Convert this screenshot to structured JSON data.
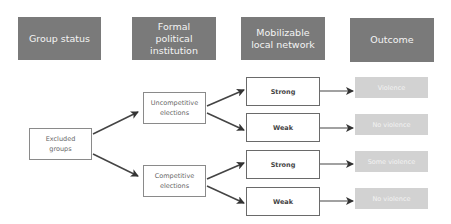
{
  "headers": {
    "group_status": "Group status",
    "institution": "Formal political institution",
    "network": "Mobilizable local network",
    "outcome": "Outcome"
  },
  "nodes": {
    "excluded": "Excluded groups",
    "uncompetitive": "Uncompetitive elections",
    "competitive": "Competitive elections",
    "strong_1": "Strong",
    "weak_1": "Weak",
    "strong_2": "Strong",
    "weak_2": "Weak"
  },
  "outcomes": {
    "o1": "Violence",
    "o2": "No violence",
    "o3": "Some violence",
    "o4": "No violence"
  },
  "colors": {
    "header_bg": "#7a7a7a",
    "outcome_bg": "#d2d2d2",
    "arrow": "#333333"
  }
}
